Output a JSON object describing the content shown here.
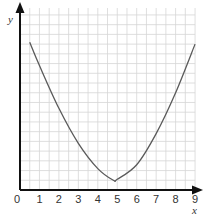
{
  "chart_data": {
    "type": "line",
    "title": "",
    "xlabel": "x",
    "ylabel": "y",
    "xlim": [
      0,
      9
    ],
    "ylim": [
      0,
      9.3
    ],
    "grid": true,
    "grid_minor_step": 0.5,
    "x_ticks": [
      "0",
      "1",
      "2",
      "3",
      "4",
      "5",
      "6",
      "7",
      "8",
      "9"
    ],
    "y_ticks": [],
    "series": [
      {
        "name": "curve",
        "description": "U-shaped parabola",
        "x": [
          0.5,
          1,
          2,
          3,
          4,
          4.8,
          5,
          6,
          7,
          8,
          9
        ],
        "y": [
          7.6,
          6.4,
          4.2,
          2.4,
          1.1,
          0.5,
          0.55,
          1.3,
          2.9,
          5.0,
          7.5
        ]
      }
    ],
    "line_color": "#5a5a5a",
    "grid_color": "#d6d6d6",
    "axis_color": "#111111"
  }
}
